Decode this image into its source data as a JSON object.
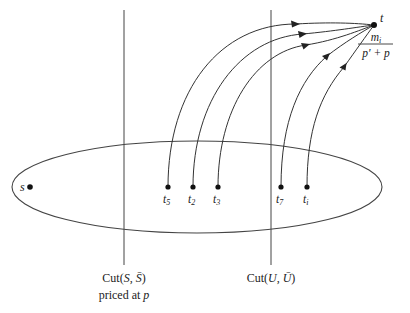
{
  "diagram": {
    "source": {
      "label": "s",
      "x": 30,
      "y": 187
    },
    "sink": {
      "label": "t",
      "x": 374,
      "y": 25,
      "capacity_numerator": "m",
      "capacity_numerator_sub": "i",
      "capacity_denominator": "p′ + p"
    },
    "nodes": [
      {
        "label": "t",
        "sub": "5",
        "x": 168,
        "y": 187
      },
      {
        "label": "t",
        "sub": "2",
        "x": 193,
        "y": 187
      },
      {
        "label": "t",
        "sub": "3",
        "x": 218,
        "y": 187
      },
      {
        "label": "t",
        "sub": "7",
        "x": 281,
        "y": 187
      },
      {
        "label": "t",
        "sub": "i",
        "x": 307,
        "y": 187
      }
    ],
    "cuts": [
      {
        "name": "Cut(S, S̄)",
        "text": "Cut(",
        "var1": "S",
        "sep": ", ",
        "var2": "S̄",
        "close": ")",
        "note": "priced at ",
        "note_var": "p",
        "x": 124
      },
      {
        "name": "Cut(U, Ū)",
        "text": "Cut(",
        "var1": "U",
        "sep": ", ",
        "var2": "Ū",
        "close": ")",
        "x": 271
      }
    ],
    "ellipse": {
      "cx": 197,
      "cy": 187,
      "rx": 185,
      "ry": 46
    }
  }
}
